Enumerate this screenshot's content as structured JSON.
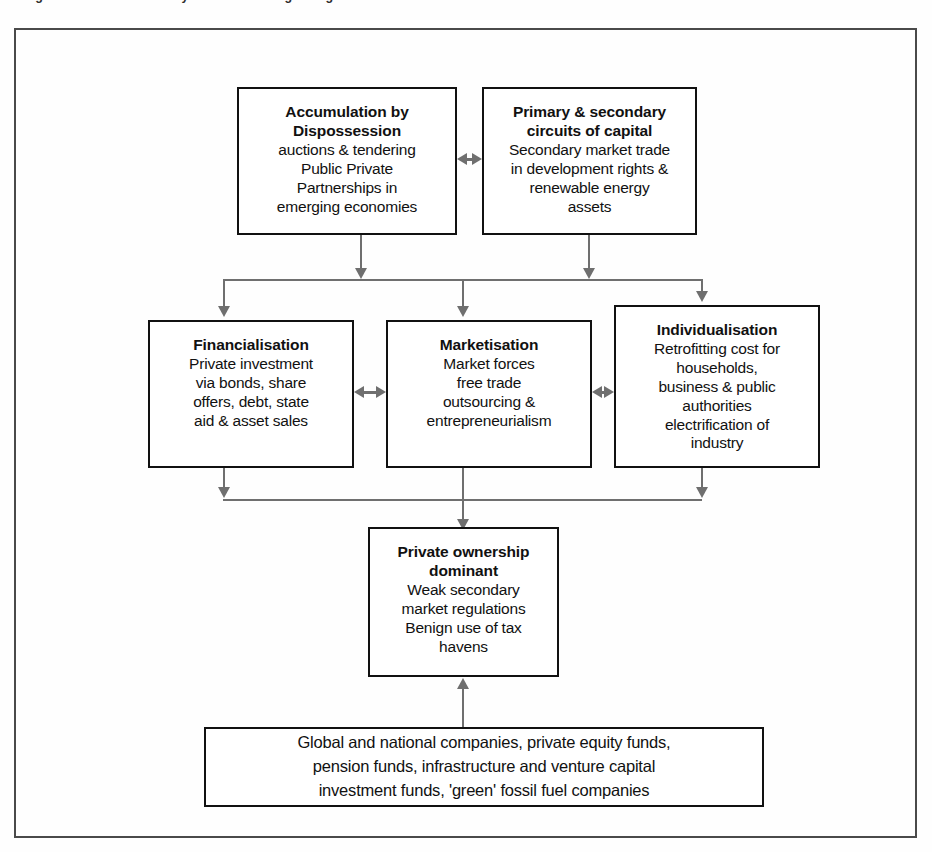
{
  "figure": {
    "caption": "Figure 4. Political economy of climate change mitigation"
  },
  "nodes": {
    "accumulation": {
      "title_line1": "Accumulation by",
      "title_line2": "Dispossession",
      "body_line1": "auctions & tendering",
      "body_line2": "Public Private",
      "body_line3": "Partnerships in",
      "body_line4": "emerging economies"
    },
    "circuits": {
      "title_line1": "Primary & secondary",
      "title_line2": "circuits of capital",
      "body_line1": "Secondary market trade",
      "body_line2": "in development rights &",
      "body_line3": "renewable energy",
      "body_line4": "assets"
    },
    "financialisation": {
      "title_line1": "Financialisation",
      "body_line1": "Private investment",
      "body_line2": "via bonds, share",
      "body_line3": "offers, debt, state",
      "body_line4": "aid & asset sales"
    },
    "marketisation": {
      "title_line1": "Marketisation",
      "body_line1": "Market forces",
      "body_line2": "free trade",
      "body_line3": "outsourcing &",
      "body_line4": "entrepreneurialism"
    },
    "individualisation": {
      "title_line1": "Individualisation",
      "body_line1": "Retrofitting cost for",
      "body_line2": "households,",
      "body_line3": "business & public",
      "body_line4": "authorities",
      "body_line5": "electrification of",
      "body_line6": "industry"
    },
    "private_ownership": {
      "title_line1": "Private ownership",
      "title_line2": "dominant",
      "body_line1": "Weak secondary",
      "body_line2": "market regulations",
      "body_line3": "Benign use of tax",
      "body_line4": "havens"
    },
    "actors": {
      "body_line1": "Global and national companies, private equity funds,",
      "body_line2": "pension funds, infrastructure and venture capital",
      "body_line3": "investment funds, 'green' fossil fuel companies"
    }
  },
  "colors": {
    "box_border": "#111111",
    "connector": "#6f6f6f",
    "frame_border": "#4a4a4a",
    "background": "#fefefe"
  }
}
